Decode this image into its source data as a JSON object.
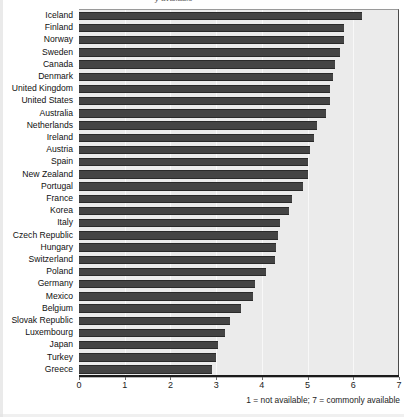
{
  "figure": {
    "title_partial": "y available",
    "axis_note": "1 = not available; 7 = commonly available"
  },
  "chart_data": {
    "type": "bar",
    "orientation": "horizontal",
    "title": "y available",
    "xlabel": "",
    "ylabel": "",
    "xlim": [
      0,
      7
    ],
    "xticks": [
      0,
      1,
      2,
      3,
      4,
      5,
      6,
      7
    ],
    "xticklabels": [
      "0",
      "1",
      "2",
      "3",
      "4",
      "5",
      "6",
      "7"
    ],
    "grid": true,
    "legend": "none",
    "annotations": [
      "1 = not available; 7 = commonly available"
    ],
    "bar_color": "#444444",
    "plot_background": "#ebebeb",
    "categories": [
      "Iceland",
      "Finland",
      "Norway",
      "Sweden",
      "Canada",
      "Denmark",
      "United Kingdom",
      "United States",
      "Australia",
      "Netherlands",
      "Ireland",
      "Austria",
      "Spain",
      "New Zealand",
      "Portugal",
      "France",
      "Korea",
      "Italy",
      "Czech Republic",
      "Hungary",
      "Switzerland",
      "Poland",
      "Germany",
      "Mexico",
      "Belgium",
      "Slovak Republic",
      "Luxembourg",
      "Japan",
      "Turkey",
      "Greece"
    ],
    "values": [
      6.2,
      5.8,
      5.8,
      5.7,
      5.6,
      5.55,
      5.5,
      5.5,
      5.4,
      5.2,
      5.15,
      5.05,
      5.0,
      5.0,
      4.9,
      4.65,
      4.6,
      4.4,
      4.35,
      4.3,
      4.28,
      4.1,
      3.85,
      3.8,
      3.55,
      3.3,
      3.2,
      3.05,
      3.0,
      2.9
    ]
  }
}
